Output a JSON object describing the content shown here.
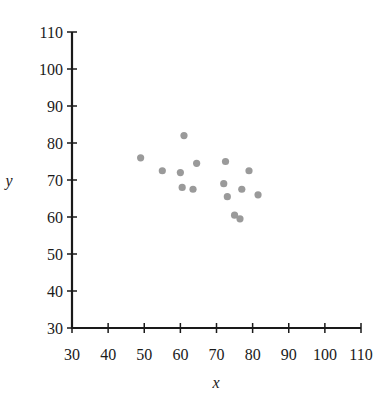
{
  "chart_data": {
    "type": "scatter",
    "title": "",
    "xlabel": "x",
    "ylabel": "y",
    "xlim": [
      30,
      110
    ],
    "ylim": [
      30,
      110
    ],
    "x_ticks": [
      30,
      40,
      50,
      60,
      70,
      80,
      90,
      100,
      110
    ],
    "y_ticks": [
      30,
      40,
      50,
      60,
      70,
      80,
      90,
      100,
      110
    ],
    "grid": false,
    "legend": null,
    "point_color": "#9a9a9a",
    "points": [
      {
        "x": 49,
        "y": 76
      },
      {
        "x": 55,
        "y": 72.5
      },
      {
        "x": 61,
        "y": 82
      },
      {
        "x": 60,
        "y": 72
      },
      {
        "x": 60.5,
        "y": 68
      },
      {
        "x": 63.5,
        "y": 67.5
      },
      {
        "x": 64.5,
        "y": 74.5
      },
      {
        "x": 72.5,
        "y": 75
      },
      {
        "x": 72,
        "y": 69
      },
      {
        "x": 73,
        "y": 65.5
      },
      {
        "x": 77,
        "y": 67.5
      },
      {
        "x": 79,
        "y": 72.5
      },
      {
        "x": 81.5,
        "y": 66
      },
      {
        "x": 75,
        "y": 60.5
      },
      {
        "x": 76.5,
        "y": 59.5
      }
    ]
  }
}
